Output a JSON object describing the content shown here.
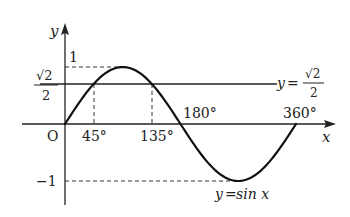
{
  "diagram": {
    "axes": {
      "x_label": "x",
      "y_label": "y",
      "origin_label": "O"
    },
    "y_ticks": {
      "one": "1",
      "neg_one": "−1",
      "sqrt2_over_2": {
        "num": "√2",
        "den": "2"
      }
    },
    "x_ticks": [
      "45°",
      "135°",
      "180°",
      "360°"
    ],
    "curve_label": {
      "lhs": "y",
      "eq": "=",
      "rhs": "sin x"
    },
    "line_label": {
      "lhs": "y",
      "eq": "=",
      "num": "√2",
      "den": "2"
    },
    "colors": {
      "stroke": "#222222",
      "background": "#ffffff"
    }
  }
}
